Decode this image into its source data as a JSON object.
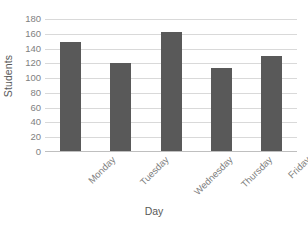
{
  "chart_data": {
    "type": "bar",
    "title": "",
    "categories": [
      "Monday",
      "Tuesday",
      "Wednesday",
      "Thursday",
      "Friday"
    ],
    "values": [
      149,
      120,
      163,
      114,
      130
    ],
    "series": [
      {
        "name": "Students",
        "values": [
          149,
          120,
          163,
          114,
          130
        ]
      }
    ],
    "xlabel": "Day",
    "ylabel": "Students",
    "ylim": [
      0,
      180
    ],
    "yticks": [
      180,
      160,
      140,
      120,
      100,
      80,
      60,
      40,
      20,
      0
    ],
    "ytick_labels": [
      "180",
      "160",
      "140",
      "120",
      "100",
      "80",
      "60",
      "40",
      "20",
      "0"
    ],
    "grid": true,
    "grid_axis": "y",
    "legend": false,
    "legend_position": "none",
    "bar_color": "#595959",
    "gridline_color": "#d9d9d9",
    "background_color": "#ffffff",
    "text_color": "#595959",
    "tick_text_color": "#7f7f7f",
    "xtick_rotation": -45
  }
}
